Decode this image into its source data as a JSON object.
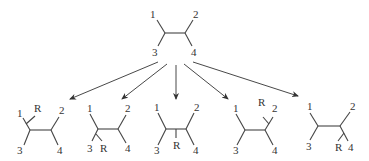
{
  "colors": {
    "line": "#444444",
    "text": "#333333",
    "background": "#ffffff"
  },
  "parent": {
    "labels": {
      "p1": "1",
      "p2": "2",
      "p3": "3",
      "p4": "4"
    }
  },
  "arrows_count": 5,
  "products": [
    {
      "id": "product-1",
      "substituent": "R",
      "position": "on carbon bearing 1, near substituent 1",
      "labels": {
        "p1": "1",
        "p2": "2",
        "p3": "3",
        "p4": "4",
        "r": "R"
      }
    },
    {
      "id": "product-2",
      "substituent": "R",
      "position": "on carbon bearing 3, near substituent 3",
      "labels": {
        "p1": "1",
        "p2": "2",
        "p3": "3",
        "p4": "4",
        "r": "R"
      }
    },
    {
      "id": "product-3",
      "substituent": "R",
      "position": "on central bond",
      "labels": {
        "p1": "1",
        "p2": "2",
        "p3": "3",
        "p4": "4",
        "r": "R"
      }
    },
    {
      "id": "product-4",
      "substituent": "R",
      "position": "on carbon bearing 2, near substituent 2",
      "labels": {
        "p1": "1",
        "p2": "2",
        "p3": "3",
        "p4": "4",
        "r": "R"
      }
    },
    {
      "id": "product-5",
      "substituent": "R",
      "position": "on carbon bearing 4, near substituent 4",
      "labels": {
        "p1": "1",
        "p2": "2",
        "p3": "3",
        "p4": "4",
        "r": "R"
      }
    }
  ]
}
